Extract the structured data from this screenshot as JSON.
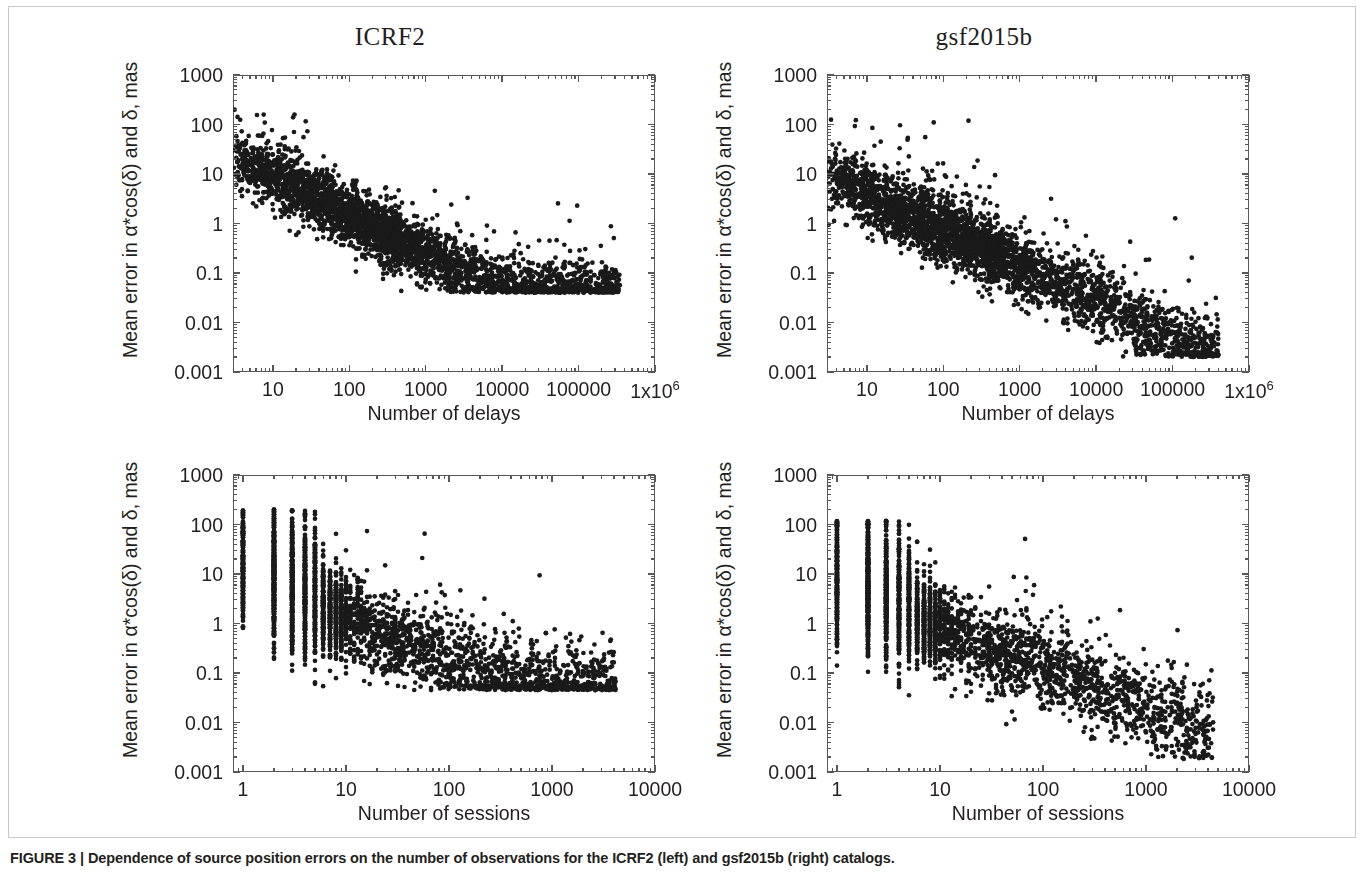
{
  "caption": {
    "figure_number": "FIGURE 3",
    "separator": "|",
    "text": "Dependence of source position errors on the number of observations for the ICRF2 (left) and gsf2015b (right) catalogs."
  },
  "colors": {
    "point": "#1a1a1a",
    "axis": "#58585a",
    "text": "#231f20",
    "border": "#c9c9c9",
    "background": "#ffffff"
  },
  "common": {
    "ylabel": "Mean error in α*cos(δ) and δ, mas",
    "ytick_labels": [
      "1000",
      "100",
      "10",
      "1",
      "0.1",
      "0.01",
      "0.001"
    ],
    "ylim": [
      0.001,
      1000
    ],
    "xlabel_delays": "Number of delays",
    "xlabel_sessions": "Number of sessions"
  },
  "chart_data": [
    {
      "id": "top-left",
      "type": "scatter",
      "title": "ICRF2",
      "xlabel": "Number of delays",
      "ylabel": "Mean error in α*cos(δ) and δ, mas",
      "xscale": "log",
      "yscale": "log",
      "xlim": [
        3,
        1000000
      ],
      "ylim": [
        0.001,
        1000
      ],
      "xtick_values": [
        10,
        100,
        1000,
        10000,
        100000,
        1000000
      ],
      "xtick_labels": [
        "10",
        "100",
        "1000",
        "10000",
        "100000",
        "1x10^6"
      ],
      "ytick_values": [
        1000,
        100,
        10,
        1,
        0.1,
        0.01,
        0.001
      ],
      "ytick_labels": [
        "1000",
        "100",
        "10",
        "1",
        "0.1",
        "0.01",
        "0.001"
      ],
      "grid": false,
      "legend": "none",
      "n_points": 3400,
      "seed": 17,
      "trend": {
        "description": "Error decreases roughly as a power law with number of delays, then flattens to a noise floor near 0.045 mas.",
        "x_min": 3,
        "x_max": 350000,
        "x_concentration": 400,
        "y_at_xmin": 22,
        "power_slope": -0.78,
        "floor": 0.045,
        "scatter_dex": 0.3,
        "outlier_fraction": 0.03,
        "outlier_boost_dex": 0.8,
        "y_max_observed": 200,
        "y_min_observed": 0.04
      }
    },
    {
      "id": "top-right",
      "type": "scatter",
      "title": "gsf2015b",
      "xlabel": "Number of delays",
      "ylabel": "Mean error in α*cos(δ) and δ, mas",
      "xscale": "log",
      "yscale": "log",
      "xlim": [
        3,
        1000000
      ],
      "ylim": [
        0.001,
        1000
      ],
      "xtick_values": [
        10,
        100,
        1000,
        10000,
        100000,
        1000000
      ],
      "xtick_labels": [
        "10",
        "100",
        "1000",
        "10000",
        "100000",
        "1x10^6"
      ],
      "ytick_values": [
        1000,
        100,
        10,
        1,
        0.1,
        0.01,
        0.001
      ],
      "ytick_labels": [
        "1000",
        "100",
        "10",
        "1",
        "0.1",
        "0.01",
        "0.001"
      ],
      "grid": false,
      "legend": "none",
      "n_points": 3400,
      "seed": 41,
      "trend": {
        "description": "Error decreases as a power law with no noise floor, reaching about 0.002 mas at the largest number of delays.",
        "x_min": 3,
        "x_max": 400000,
        "x_concentration": 400,
        "y_at_xmin": 9,
        "power_slope": -0.72,
        "floor": 0.0018,
        "scatter_dex": 0.33,
        "outlier_fraction": 0.035,
        "outlier_boost_dex": 0.9,
        "y_max_observed": 130,
        "y_min_observed": 0.002
      }
    },
    {
      "id": "bottom-left",
      "type": "scatter",
      "title": "ICRF2",
      "xlabel": "Number of sessions",
      "ylabel": "Mean error in α*cos(δ) and δ, mas",
      "xscale": "log",
      "yscale": "log",
      "xlim": [
        0.8,
        10000
      ],
      "ylim": [
        0.001,
        1000
      ],
      "xtick_values": [
        1,
        10,
        100,
        1000,
        10000
      ],
      "xtick_labels": [
        "1",
        "10",
        "100",
        "1000",
        "10000"
      ],
      "ytick_values": [
        1000,
        100,
        10,
        1,
        0.1,
        0.01,
        0.001
      ],
      "ytick_labels": [
        "1000",
        "100",
        "10",
        "1",
        "0.1",
        "0.01",
        "0.001"
      ],
      "grid": false,
      "legend": "none",
      "n_points": 3400,
      "seed": 5,
      "integer_x": true,
      "trend": {
        "description": "Sessions are integers, forming vertical stripes at small n. Error falls with session count and flattens near 0.05 mas.",
        "x_min": 1,
        "x_max": 4200,
        "x_concentration": 9,
        "y_at_xmin": 9,
        "power_slope": -0.85,
        "floor": 0.05,
        "scatter_dex": 0.42,
        "outlier_fraction": 0.03,
        "outlier_boost_dex": 0.8,
        "y_max_observed": 200,
        "y_min_observed": 0.045
      }
    },
    {
      "id": "bottom-right",
      "type": "scatter",
      "title": "gsf2015b",
      "xlabel": "Number of sessions",
      "ylabel": "Mean error in α*cos(δ) and δ, mas",
      "xscale": "log",
      "yscale": "log",
      "xlim": [
        0.8,
        10000
      ],
      "ylim": [
        0.001,
        1000
      ],
      "xtick_values": [
        1,
        10,
        100,
        1000,
        10000
      ],
      "xtick_labels": [
        "1",
        "10",
        "100",
        "1000",
        "10000"
      ],
      "ytick_values": [
        1000,
        100,
        10,
        1,
        0.1,
        0.01,
        0.001
      ],
      "ytick_labels": [
        "1000",
        "100",
        "10",
        "1",
        "0.1",
        "0.01",
        "0.001"
      ],
      "grid": false,
      "legend": "none",
      "n_points": 3400,
      "seed": 73,
      "integer_x": true,
      "trend": {
        "description": "Sessions are integers, forming vertical stripes at small n. Error falls steadily with no floor, reaching about 0.002 mas.",
        "x_min": 1,
        "x_max": 4500,
        "x_concentration": 9,
        "y_at_xmin": 5,
        "power_slope": -0.8,
        "floor": 0.002,
        "scatter_dex": 0.42,
        "outlier_fraction": 0.03,
        "outlier_boost_dex": 0.85,
        "y_max_observed": 120,
        "y_min_observed": 0.0018
      }
    }
  ]
}
